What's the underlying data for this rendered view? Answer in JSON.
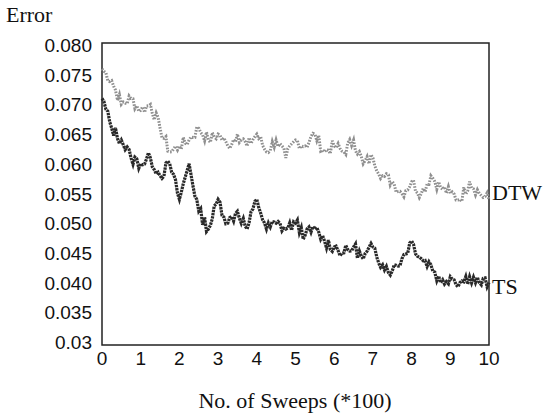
{
  "chart_data": {
    "type": "line",
    "title": "",
    "xlabel": "No. of Sweeps (*100)",
    "ylabel": "Error",
    "xlim": [
      0,
      10
    ],
    "ylim": [
      0.03,
      0.08
    ],
    "grid": false,
    "legend_position": "right (inline labels at line ends)",
    "x_ticks": [
      "0",
      "1",
      "2",
      "3",
      "4",
      "5",
      "6",
      "7",
      "8",
      "9",
      "10"
    ],
    "y_ticks": [
      "0.080",
      "0.075",
      "0.070",
      "0.065",
      "0.060",
      "0.055",
      "0.050",
      "0.045",
      "0.040",
      "0.035",
      "0.03"
    ],
    "x": [
      0.0,
      0.25,
      0.5,
      0.75,
      1.0,
      1.25,
      1.5,
      1.75,
      2.0,
      2.25,
      2.5,
      2.75,
      3.0,
      3.25,
      3.5,
      3.75,
      4.0,
      4.25,
      4.5,
      4.75,
      5.0,
      5.25,
      5.5,
      5.75,
      6.0,
      6.25,
      6.5,
      6.75,
      7.0,
      7.25,
      7.5,
      7.75,
      8.0,
      8.25,
      8.5,
      8.75,
      9.0,
      9.25,
      9.5,
      9.75,
      10.0
    ],
    "series": [
      {
        "name": "DTW",
        "style": "dotted",
        "color": "#8a8a8a",
        "values": [
          0.076,
          0.074,
          0.07,
          0.071,
          0.069,
          0.07,
          0.066,
          0.062,
          0.063,
          0.064,
          0.066,
          0.064,
          0.065,
          0.063,
          0.065,
          0.063,
          0.065,
          0.062,
          0.064,
          0.061,
          0.064,
          0.063,
          0.065,
          0.062,
          0.063,
          0.062,
          0.064,
          0.06,
          0.061,
          0.058,
          0.057,
          0.055,
          0.057,
          0.055,
          0.058,
          0.056,
          0.055,
          0.054,
          0.057,
          0.055,
          0.054
        ]
      },
      {
        "name": "TS",
        "style": "solid-dense",
        "color": "#2a2a2a",
        "values": [
          0.071,
          0.066,
          0.064,
          0.061,
          0.06,
          0.061,
          0.058,
          0.06,
          0.054,
          0.06,
          0.052,
          0.049,
          0.054,
          0.05,
          0.052,
          0.049,
          0.054,
          0.049,
          0.05,
          0.049,
          0.05,
          0.048,
          0.049,
          0.047,
          0.046,
          0.045,
          0.046,
          0.044,
          0.046,
          0.043,
          0.042,
          0.044,
          0.047,
          0.044,
          0.043,
          0.04,
          0.041,
          0.04,
          0.041,
          0.04,
          0.04
        ]
      }
    ]
  },
  "axes": {
    "y_title": "Error",
    "x_title": "No. of Sweeps (*100)",
    "y_ticks": [
      {
        "label": "0.080",
        "value": 0.08
      },
      {
        "label": "0.075",
        "value": 0.075
      },
      {
        "label": "0.070",
        "value": 0.07
      },
      {
        "label": "0.065",
        "value": 0.065
      },
      {
        "label": "0.060",
        "value": 0.06
      },
      {
        "label": "0.055",
        "value": 0.055
      },
      {
        "label": "0.050",
        "value": 0.05
      },
      {
        "label": "0.045",
        "value": 0.045
      },
      {
        "label": "0.040",
        "value": 0.04
      },
      {
        "label": "0.035",
        "value": 0.035
      },
      {
        "label": "0.03",
        "value": 0.03
      }
    ],
    "x_ticks": [
      {
        "label": "0",
        "value": 0
      },
      {
        "label": "1",
        "value": 1
      },
      {
        "label": "2",
        "value": 2
      },
      {
        "label": "3",
        "value": 3
      },
      {
        "label": "4",
        "value": 4
      },
      {
        "label": "5",
        "value": 5
      },
      {
        "label": "6",
        "value": 6
      },
      {
        "label": "7",
        "value": 7
      },
      {
        "label": "8",
        "value": 8
      },
      {
        "label": "9",
        "value": 9
      },
      {
        "label": "10",
        "value": 10
      }
    ]
  },
  "series_labels": {
    "dtw": "DTW",
    "ts": "TS"
  }
}
